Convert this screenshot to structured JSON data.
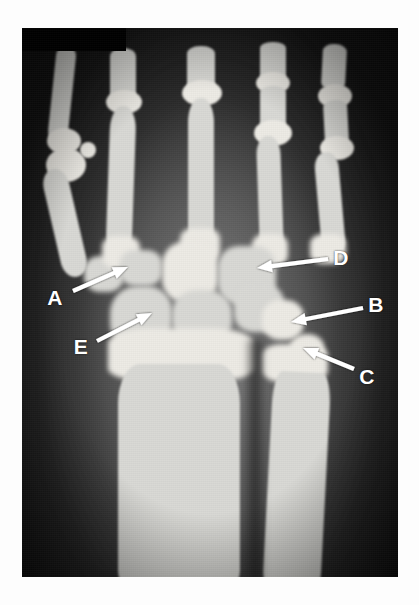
{
  "figure": {
    "kind": "radiograph",
    "modality": "X-ray",
    "view": "posteroanterior wrist and hand",
    "background_color": "#ffffff",
    "annotation_color": "#ffffff",
    "plate": {
      "x": 22,
      "y": 28,
      "width": 376,
      "height": 549
    }
  },
  "annotations": [
    {
      "id": "A",
      "label": "A",
      "label_x": 55,
      "label_y": 297,
      "tip_x": 128,
      "tip_y": 267,
      "tail_x": 73,
      "tail_y": 291
    },
    {
      "id": "B",
      "label": "B",
      "label_x": 376,
      "label_y": 304,
      "tip_x": 291,
      "tip_y": 322,
      "tail_x": 363,
      "tail_y": 308
    },
    {
      "id": "C",
      "label": "C",
      "label_x": 367,
      "label_y": 376,
      "tip_x": 303,
      "tip_y": 348,
      "tail_x": 354,
      "tail_y": 369
    },
    {
      "id": "D",
      "label": "D",
      "label_x": 341,
      "label_y": 257,
      "tip_x": 257,
      "tip_y": 268,
      "tail_x": 328,
      "tail_y": 259
    },
    {
      "id": "E",
      "label": "E",
      "label_x": 81,
      "label_y": 346,
      "tip_x": 152,
      "tip_y": 313,
      "tail_x": 97,
      "tail_y": 341
    }
  ]
}
